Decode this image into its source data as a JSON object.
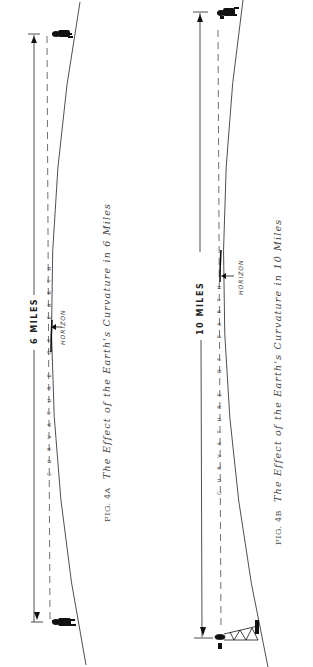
{
  "figures": [
    {
      "id": "4A",
      "caption_label": "FIG. 4A",
      "caption_title": "The Effect of the Earth's Curvature in 6 Miles",
      "distance_label": "6 MILES",
      "horizon_label": "HORIZON",
      "curvature_label": "CURVATURE OF EARTH",
      "observer_top": "person-figure",
      "observer_bottom": "person-figure"
    },
    {
      "id": "4B",
      "caption_label": "FIG. 4B",
      "caption_title": "The Effect of the Earth's Curvature in 10 Miles",
      "distance_label": "10 MILES",
      "horizon_label": "HORIZON",
      "curvature_label": "CURVATURE OF EARTH",
      "observer_top": "person-figure",
      "observer_bottom": "tower-with-observer"
    }
  ],
  "colors": {
    "ink": "#1a1a1a",
    "background": "#ffffff"
  }
}
